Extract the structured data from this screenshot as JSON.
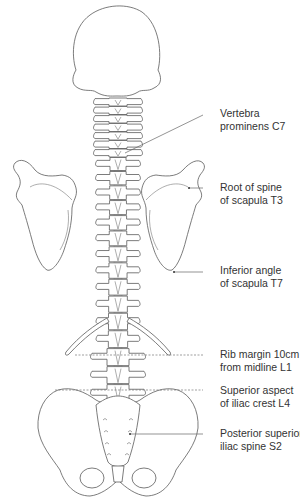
{
  "diagram": {
    "labels": [
      {
        "id": "c7",
        "line1": "Vertebra",
        "line2": "prominens C7",
        "leader": "solid"
      },
      {
        "id": "t3",
        "line1": "Root of spine",
        "line2": "of scapula T3",
        "leader": "solid"
      },
      {
        "id": "t7",
        "line1": "Inferior angle",
        "line2": "of scapula T7",
        "leader": "solid"
      },
      {
        "id": "l1",
        "line1": "Rib margin 10cm",
        "line2": "from midline L1",
        "leader": "dashed"
      },
      {
        "id": "l4",
        "line1": "Superior aspect",
        "line2": "of iliac crest L4",
        "leader": "dashed"
      },
      {
        "id": "s2",
        "line1": "Posterior superior",
        "line2": "iliac spine S2",
        "leader": "solid"
      }
    ],
    "structures": [
      "skull",
      "cervical-spine",
      "thoracic-spine",
      "lumbar-spine",
      "left-scapula",
      "right-scapula",
      "twelfth-ribs",
      "pelvis",
      "sacrum"
    ]
  }
}
